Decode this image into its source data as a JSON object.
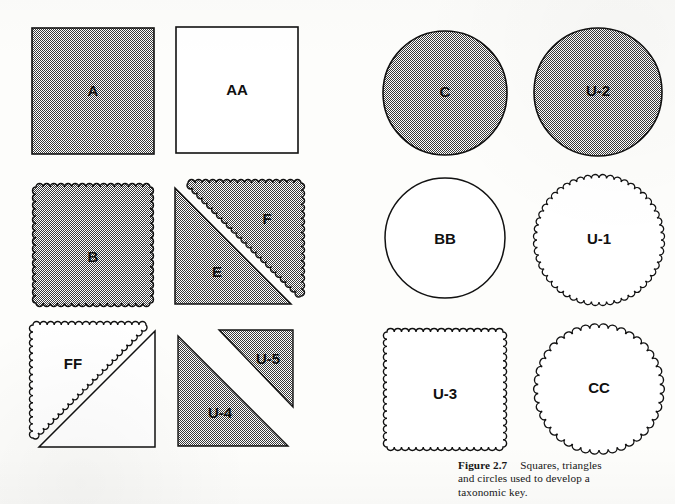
{
  "figure": {
    "number": "Figure 2.7",
    "caption_text": "Squares, triangles and circles used to develop a taxonomic key.",
    "caption_line_1": "Squares, triangles",
    "caption_line_2": "and circles used to develop a",
    "caption_line_3": "taxonomic key."
  },
  "style": {
    "fill_gray": "#a9a9a9",
    "outline": "#111111",
    "page_background": "#fdfdfb",
    "label_color": "#101010"
  },
  "shapes": {
    "a": {
      "label": "A",
      "form": "square",
      "edge": "straight",
      "fill": "shaded"
    },
    "aa": {
      "label": "AA",
      "form": "square",
      "edge": "straight",
      "fill": "white"
    },
    "b": {
      "label": "B",
      "form": "square",
      "edge": "scalloped",
      "fill": "shaded"
    },
    "e": {
      "label": "E",
      "form": "triangle-lower-left",
      "edge": "straight",
      "fill": "shaded"
    },
    "f": {
      "label": "F",
      "form": "triangle-upper-right",
      "edge": "scalloped",
      "fill": "shaded"
    },
    "ff": {
      "label": "FF",
      "form": "triangle-upper-left",
      "edge": "scalloped",
      "fill": "white"
    },
    "ff_partner": {
      "label": "",
      "form": "triangle-lower-right",
      "edge": "straight",
      "fill": "white"
    },
    "u4": {
      "label": "U-4",
      "form": "triangle-lower-left",
      "edge": "straight",
      "fill": "shaded"
    },
    "u5": {
      "label": "U-5",
      "form": "triangle-upper-right",
      "edge": "straight",
      "fill": "shaded"
    },
    "c": {
      "label": "C",
      "form": "circle",
      "edge": "smooth",
      "fill": "shaded"
    },
    "u2": {
      "label": "U-2",
      "form": "circle",
      "edge": "smooth",
      "fill": "shaded"
    },
    "bb": {
      "label": "BB",
      "form": "circle",
      "edge": "smooth",
      "fill": "white"
    },
    "u1": {
      "label": "U-1",
      "form": "circle",
      "edge": "scalloped",
      "fill": "white"
    },
    "u3": {
      "label": "U-3",
      "form": "square",
      "edge": "scalloped",
      "fill": "white"
    },
    "cc": {
      "label": "CC",
      "form": "circle",
      "edge": "scalloped",
      "fill": "white"
    }
  }
}
